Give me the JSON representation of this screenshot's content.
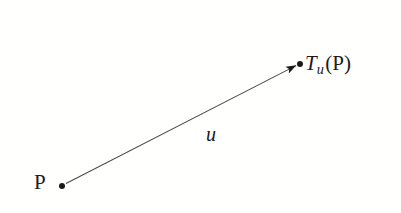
{
  "figure": {
    "background_color": "#fffffd",
    "ink_color": "#1a1a1a",
    "line_color": "#4a4a4a",
    "width": 401,
    "height": 213
  },
  "labels": {
    "source_point": "P",
    "vector_name": "u",
    "image_point_function": "T",
    "image_point_subscript": "u",
    "image_point_argument": "(P)",
    "image_point_full": "T_u(P)"
  },
  "geometry": {
    "source_point": {
      "x": 62,
      "y": 186
    },
    "target_point": {
      "x": 300,
      "y": 64
    },
    "arrow_start": {
      "x": 65,
      "y": 184
    },
    "arrow_end": {
      "x": 299,
      "y": 64
    },
    "point_radius": 3,
    "line_width": 1,
    "arrowhead_length": 11,
    "arrowhead_width": 7
  },
  "chart_data": {
    "type": "scatter",
    "xlabel": "",
    "ylabel": "",
    "points": [
      {
        "name": "P",
        "x": 62,
        "y": 186,
        "label": "P"
      },
      {
        "name": "T_u(P)",
        "x": 300,
        "y": 64,
        "label": "T_u(P)"
      }
    ],
    "arrows": [
      {
        "name": "u",
        "from": "P",
        "to": "T_u(P)",
        "label": "u"
      }
    ],
    "grid": false,
    "legend": "none"
  }
}
